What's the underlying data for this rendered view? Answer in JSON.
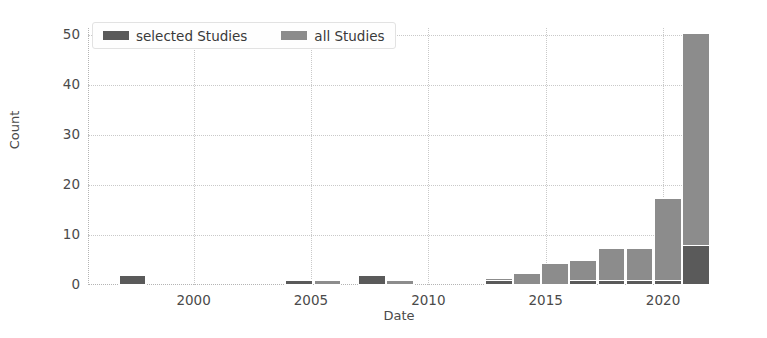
{
  "chart_data": {
    "type": "bar",
    "title": "",
    "subtitle": "",
    "xlabel": "Date",
    "ylabel": "Count",
    "xlim": [
      1995.5,
      2022.0
    ],
    "ylim": [
      0,
      51.5
    ],
    "grid": true,
    "legend_position": "upper left",
    "xticks": [
      2000,
      2005,
      2010,
      2015,
      2020
    ],
    "xtick_labels": [
      "2000",
      "2005",
      "2010",
      "2015",
      "2020"
    ],
    "yticks": [
      0,
      10,
      20,
      30,
      40,
      50
    ],
    "ytick_labels": [
      "0",
      "10",
      "20",
      "30",
      "40",
      "50"
    ],
    "bin_width_years": 1.18,
    "colors": {
      "selected_studies": "#5a5a5a",
      "all_studies": "#8c8c8c",
      "grid": "#c9c9c9",
      "text": "#4a4a4a",
      "background": "#ffffff"
    },
    "series": [
      {
        "name": "selected Studies",
        "color": "#5a5a5a",
        "values": [
          2,
          0,
          0,
          0,
          0,
          0,
          1,
          0,
          2,
          0,
          0,
          0,
          0,
          0,
          1,
          0,
          1,
          1,
          1,
          1,
          1,
          8
        ]
      },
      {
        "name": "all Studies",
        "color": "#8c8c8c",
        "values": [
          2,
          0,
          0,
          0,
          0,
          0,
          1,
          1,
          2,
          1,
          0,
          0,
          0,
          1.5,
          2.5,
          4.5,
          5,
          7.5,
          7.5,
          7.5,
          17.5,
          50.5
        ]
      }
    ],
    "bins": [
      {
        "x": 1997.4,
        "all": 2,
        "selected": 2
      },
      {
        "x": 2004.5,
        "all": 1,
        "selected": 1
      },
      {
        "x": 2005.7,
        "all": 1,
        "selected": 0
      },
      {
        "x": 2007.6,
        "all": 2,
        "selected": 2
      },
      {
        "x": 2008.8,
        "all": 1,
        "selected": 0
      },
      {
        "x": 2013.0,
        "all": 1.5,
        "selected": 1
      },
      {
        "x": 2014.2,
        "all": 2.5,
        "selected": 0
      },
      {
        "x": 2015.4,
        "all": 4.5,
        "selected": 0
      },
      {
        "x": 2016.6,
        "all": 5,
        "selected": 1
      },
      {
        "x": 2017.8,
        "all": 7.5,
        "selected": 1
      },
      {
        "x": 2019.0,
        "all": 7.5,
        "selected": 1
      },
      {
        "x": 2020.2,
        "all": 17.5,
        "selected": 1
      },
      {
        "x": 2021.4,
        "all": 50.5,
        "selected": 8
      }
    ]
  },
  "legend": {
    "entries": [
      {
        "label": "selected Studies",
        "swatch_name": "legend-swatch-selected-studies"
      },
      {
        "label": "all Studies",
        "swatch_name": "legend-swatch-all-studies"
      }
    ]
  },
  "axes": {
    "ylabel": "Count",
    "xlabel": "Date"
  }
}
